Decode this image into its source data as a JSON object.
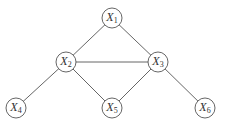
{
  "diagram": {
    "type": "undirected-graph",
    "colors": {
      "stroke": "#555555",
      "text": "#333333",
      "background": "#ffffff"
    },
    "nodes": [
      {
        "id": "X1",
        "label": "X",
        "sub": "1",
        "x": 112,
        "y": 18
      },
      {
        "id": "X2",
        "label": "X",
        "sub": "2",
        "x": 66,
        "y": 62
      },
      {
        "id": "X3",
        "label": "X",
        "sub": "3",
        "x": 158,
        "y": 62
      },
      {
        "id": "X4",
        "label": "X",
        "sub": "4",
        "x": 16,
        "y": 108
      },
      {
        "id": "X5",
        "label": "X",
        "sub": "5",
        "x": 112,
        "y": 108
      },
      {
        "id": "X6",
        "label": "X",
        "sub": "6",
        "x": 205,
        "y": 108
      }
    ],
    "edges": [
      [
        "X1",
        "X2"
      ],
      [
        "X1",
        "X3"
      ],
      [
        "X2",
        "X3"
      ],
      [
        "X2",
        "X4"
      ],
      [
        "X2",
        "X5"
      ],
      [
        "X3",
        "X5"
      ],
      [
        "X3",
        "X6"
      ]
    ],
    "node_radius": 10
  }
}
